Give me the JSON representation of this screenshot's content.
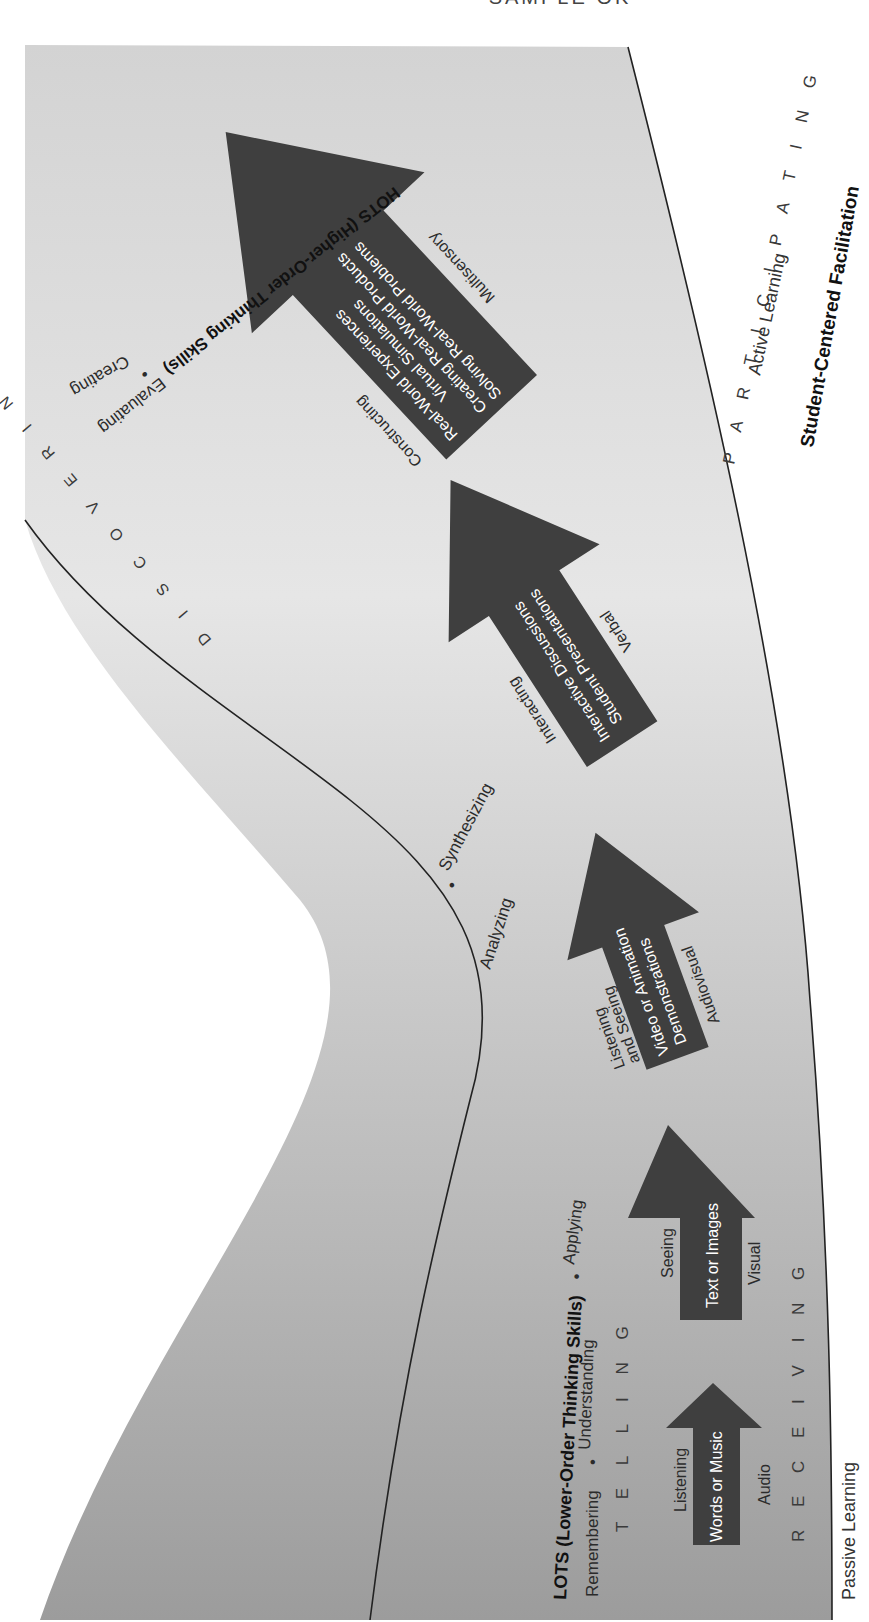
{
  "top_cut_text": "SAMPLE OK",
  "colors": {
    "band_light": "#efefef",
    "band_mid": "#d6d6d6",
    "band_dark": "#9a9a9a",
    "arrow": "#3f3f3f",
    "arrow_text": "#ffffff",
    "curve": "#222222"
  },
  "axis_labels": {
    "lots": "LOTS (Lower-Order Thinking Skills)",
    "hots": "HOTS (Higher-Order Thinking Skills)",
    "passive": "Passive Learning",
    "active": "Active Learning",
    "student_centered": "Student-Centered Facilitation"
  },
  "skills": {
    "lots": [
      "Remembering",
      "Understanding",
      "Applying"
    ],
    "hots": [
      "Analyzing",
      "Synthesizing",
      "Evaluating",
      "Creating"
    ],
    "separator": "•"
  },
  "modes": {
    "telling": "T E L L I N G",
    "receiving": "R E C E I V I N G",
    "discovering": "D I S C O V E R I N G",
    "participating": "P A R T I C I P A T I N G"
  },
  "arrows": [
    {
      "top_label": "Listening",
      "lines": [
        "Words or Music"
      ],
      "bottom_label": "Audio"
    },
    {
      "top_label": "Seeing",
      "lines": [
        "Text or Images"
      ],
      "bottom_label": "Visual"
    },
    {
      "top_label": "Listening and Seeing",
      "top_lines": [
        "Listening",
        "and Seeing"
      ],
      "lines": [
        "Video or Animation",
        "Demonstrations"
      ],
      "bottom_label": "Audiovisual"
    },
    {
      "top_label": "Interacting",
      "lines": [
        "Interactive Discussions",
        "Student Presentations"
      ],
      "bottom_label": "Verbal"
    },
    {
      "top_label": "Constructing",
      "lines": [
        "Real-World Experiences",
        "Virtual Simulations",
        "Creating Real-World Products",
        "Solving Real-World Problems"
      ],
      "bottom_label": "Multisensory"
    }
  ]
}
